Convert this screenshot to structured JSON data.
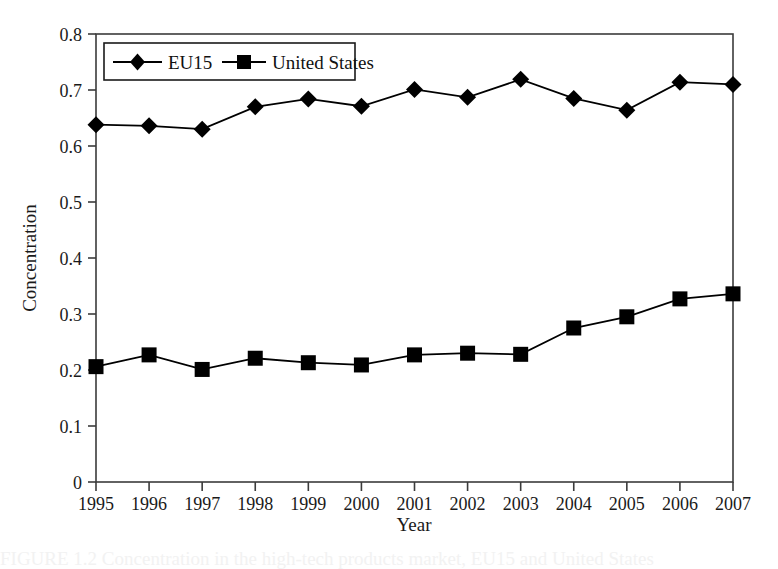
{
  "chart_data": {
    "type": "line",
    "title": "",
    "xlabel": "Year",
    "ylabel": "Concentration",
    "categories": [
      "1995",
      "1996",
      "1997",
      "1998",
      "1999",
      "2000",
      "2001",
      "2002",
      "2003",
      "2004",
      "2005",
      "2006",
      "2007"
    ],
    "x": [
      1995,
      1996,
      1997,
      1998,
      1999,
      2000,
      2001,
      2002,
      2003,
      2004,
      2005,
      2006,
      2007
    ],
    "series": [
      {
        "name": "EU15",
        "marker": "diamond",
        "values": [
          0.638,
          0.636,
          0.63,
          0.67,
          0.684,
          0.671,
          0.701,
          0.687,
          0.719,
          0.685,
          0.664,
          0.714,
          0.71
        ]
      },
      {
        "name": "United States",
        "marker": "square",
        "values": [
          0.206,
          0.227,
          0.201,
          0.221,
          0.213,
          0.209,
          0.227,
          0.23,
          0.228,
          0.275,
          0.295,
          0.327,
          0.336
        ]
      }
    ],
    "xlim": [
      1995,
      2007
    ],
    "ylim": [
      0,
      0.8
    ],
    "yticks": [
      0,
      0.1,
      0.2,
      0.3,
      0.4,
      0.5,
      0.6,
      0.7,
      0.8
    ],
    "ytick_labels": [
      "0",
      "0.1",
      "0.2",
      "0.3",
      "0.4",
      "0.5",
      "0.6",
      "0.7",
      "0.8"
    ],
    "grid": false,
    "legend_position": "top-left-inside",
    "line_color": "#000000",
    "marker_color": "#000000",
    "axis_color": "#3b3b3b",
    "background": "#ffffff"
  },
  "legend": {
    "entries": [
      {
        "label": "EU15",
        "marker": "diamond-marker"
      },
      {
        "label": "United States",
        "marker": "square-marker"
      }
    ]
  },
  "axes": {
    "y_title": "Concentration",
    "x_title": "Year"
  },
  "caption": {
    "text": "FIGURE 1.2  Concentration in the high-tech products market, EU15 and United States"
  }
}
